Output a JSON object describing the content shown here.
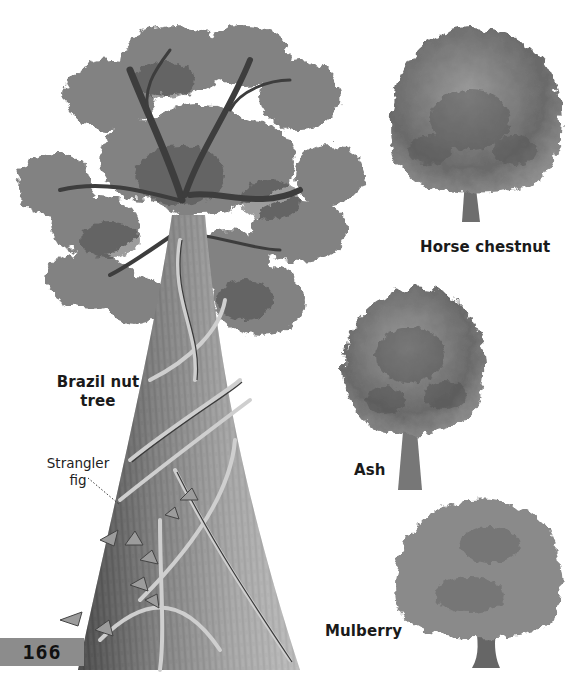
{
  "page": {
    "number": "166",
    "palette": {
      "background": "#ffffff",
      "ink": "#1a1a1a",
      "page_tab": "#8c8c8c",
      "foliage_dark": "#4a4a4a",
      "foliage_mid": "#7a7a7a",
      "foliage_light": "#b5b5b5",
      "trunk": "#6e6e6e"
    }
  },
  "illustrations": [
    {
      "id": "brazil-nut-tree",
      "label": "Brazil nut\ntree",
      "label_lines": [
        "Brazil nut",
        "tree"
      ]
    },
    {
      "id": "horse-chestnut",
      "label": "Horse chestnut"
    },
    {
      "id": "ash",
      "label": "Ash"
    },
    {
      "id": "mulberry",
      "label": "Mulberry"
    }
  ],
  "callouts": [
    {
      "id": "strangler-fig",
      "label_lines": [
        "Strangler",
        "fig"
      ]
    }
  ]
}
